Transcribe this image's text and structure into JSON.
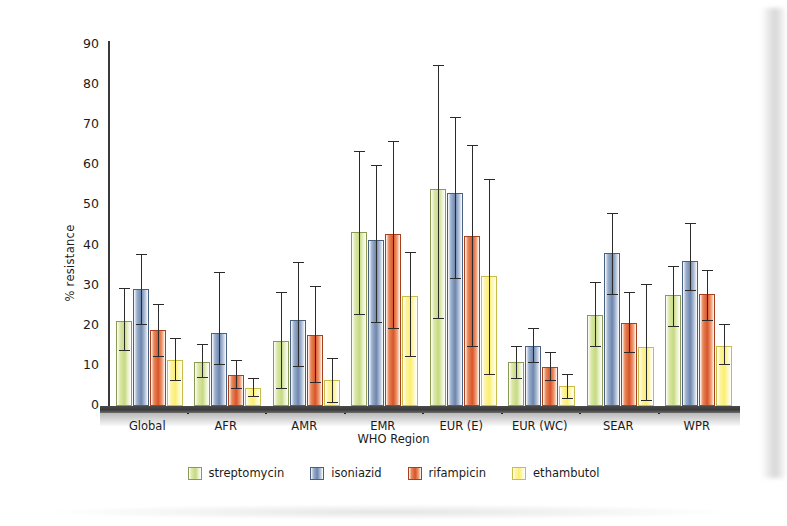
{
  "chart_data": {
    "type": "bar",
    "title": "",
    "xlabel": "WHO Region",
    "ylabel": "% resistance",
    "ylim": [
      0,
      90
    ],
    "ytick_step": 10,
    "yticks": [
      0,
      10,
      20,
      30,
      40,
      50,
      60,
      70,
      80,
      90
    ],
    "grid": false,
    "legend_position": "bottom",
    "error_bars": true,
    "categories": [
      "Global",
      "AFR",
      "AMR",
      "EMR",
      "EUR (E)",
      "EUR (WC)",
      "SEAR",
      "WPR"
    ],
    "series": [
      {
        "name": "streptomycin",
        "color": "#c5da82",
        "values": [
          21.3,
          11.0,
          16.2,
          43.5,
          54.0,
          11.0,
          22.8,
          27.6
        ],
        "err_low": [
          14.0,
          7.3,
          4.5,
          23.0,
          22.0,
          7.0,
          15.0,
          20.0
        ],
        "err_high": [
          29.5,
          15.5,
          28.5,
          63.5,
          85.0,
          15.0,
          31.0,
          35.0
        ]
      },
      {
        "name": "isoniazid",
        "color": "#6d86ad",
        "values": [
          29.2,
          18.2,
          21.5,
          41.5,
          53.2,
          15.0,
          38.2,
          36.2
        ],
        "err_low": [
          20.5,
          10.5,
          10.0,
          21.0,
          32.0,
          11.0,
          28.0,
          29.0
        ],
        "err_high": [
          38.0,
          33.5,
          36.0,
          60.0,
          72.0,
          19.5,
          48.0,
          45.5
        ]
      },
      {
        "name": "rifampicin",
        "color": "#d9542a",
        "values": [
          19.0,
          7.8,
          17.8,
          43.0,
          42.3,
          9.8,
          20.6,
          27.9
        ],
        "err_low": [
          12.5,
          4.5,
          6.0,
          19.5,
          15.0,
          6.5,
          13.5,
          21.5
        ],
        "err_high": [
          25.5,
          11.5,
          30.0,
          66.0,
          65.0,
          13.5,
          28.5,
          34.0
        ]
      },
      {
        "name": "ethambutol",
        "color": "#fbef6e",
        "values": [
          11.5,
          4.5,
          6.4,
          27.5,
          32.4,
          5.0,
          14.8,
          15.0
        ],
        "err_low": [
          6.5,
          2.5,
          1.0,
          12.5,
          8.0,
          2.0,
          1.5,
          10.5
        ],
        "err_high": [
          17.0,
          7.0,
          12.0,
          38.5,
          56.5,
          8.0,
          30.5,
          20.5
        ]
      }
    ]
  },
  "legend": {
    "items": [
      {
        "label": "streptomycin"
      },
      {
        "label": "isoniazid"
      },
      {
        "label": "rifampicin"
      },
      {
        "label": "ethambutol"
      }
    ]
  },
  "axes": {
    "y_title": "% resistance",
    "x_title": "WHO Region"
  }
}
